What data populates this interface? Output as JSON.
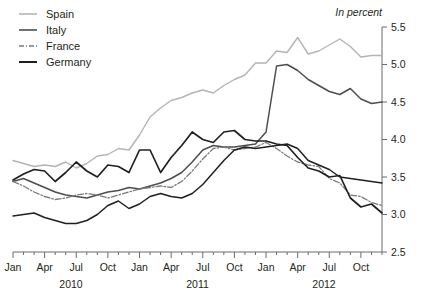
{
  "chart_data": {
    "type": "line",
    "title": "",
    "subtitle": "",
    "unit_note": "In percent",
    "xlabel": "",
    "ylabel": "",
    "ylim": [
      2.5,
      5.5
    ],
    "ytick_values": [
      2.5,
      3.0,
      3.5,
      4.0,
      4.5,
      5.0,
      5.5
    ],
    "ytick_labels": [
      "2.5",
      "3.0",
      "3.5",
      "4.0",
      "4.5",
      "5.0",
      "5.5"
    ],
    "y_axis_position": "right",
    "grid": false,
    "legend_position": "top-left",
    "xtick_labels": [
      "Jan",
      "Apr",
      "Jul",
      "Oct",
      "Jan",
      "Apr",
      "Jul",
      "Oct",
      "Jan",
      "Apr",
      "Jul",
      "Oct"
    ],
    "year_labels": [
      "2010",
      "2011",
      "2012"
    ],
    "x": [
      "2010-01",
      "2010-02",
      "2010-03",
      "2010-04",
      "2010-05",
      "2010-06",
      "2010-07",
      "2010-08",
      "2010-09",
      "2010-10",
      "2010-11",
      "2010-12",
      "2011-01",
      "2011-02",
      "2011-03",
      "2011-04",
      "2011-05",
      "2011-06",
      "2011-07",
      "2011-08",
      "2011-09",
      "2011-10",
      "2011-11",
      "2011-12",
      "2012-01",
      "2012-02",
      "2012-03",
      "2012-04",
      "2012-05",
      "2012-06",
      "2012-07",
      "2012-08",
      "2012-09",
      "2012-10",
      "2012-11",
      "2012-12"
    ],
    "series": [
      {
        "name": "Spain",
        "color": "#b4b4b4",
        "style": "solid",
        "width": 1.4,
        "values": [
          3.72,
          3.68,
          3.64,
          3.66,
          3.64,
          3.7,
          3.62,
          3.68,
          3.78,
          3.8,
          3.88,
          3.86,
          4.06,
          4.3,
          4.42,
          4.52,
          4.56,
          4.62,
          4.66,
          4.62,
          4.72,
          4.8,
          4.86,
          5.02,
          5.02,
          5.18,
          5.16,
          5.36,
          5.14,
          5.18,
          5.26,
          5.34,
          5.24,
          5.1,
          5.12,
          5.12
        ]
      },
      {
        "name": "Italy",
        "color": "#4d4d4d",
        "style": "solid",
        "width": 1.5,
        "values": [
          3.44,
          3.48,
          3.42,
          3.36,
          3.3,
          3.26,
          3.24,
          3.22,
          3.26,
          3.3,
          3.32,
          3.36,
          3.34,
          3.38,
          3.42,
          3.48,
          3.56,
          3.7,
          3.86,
          3.92,
          3.9,
          3.9,
          3.92,
          3.94,
          4.1,
          4.98,
          5.0,
          4.92,
          4.8,
          4.72,
          4.64,
          4.6,
          4.68,
          4.54,
          4.48,
          4.5
        ]
      },
      {
        "name": "France",
        "color": "#7a7a7a",
        "style": "dashdot",
        "width": 1.3,
        "values": [
          3.44,
          3.38,
          3.3,
          3.24,
          3.2,
          3.22,
          3.26,
          3.28,
          3.26,
          3.22,
          3.26,
          3.3,
          3.34,
          3.36,
          3.38,
          3.36,
          3.44,
          3.58,
          3.74,
          3.88,
          3.9,
          3.86,
          3.88,
          3.9,
          3.96,
          3.88,
          3.78,
          3.7,
          3.66,
          3.64,
          3.48,
          3.42,
          3.26,
          3.24,
          3.16,
          3.12
        ]
      },
      {
        "name": "Germany",
        "color": "#231f20",
        "style": "solid",
        "width": 1.7,
        "values": [
          3.46,
          3.54,
          3.6,
          3.58,
          3.44,
          3.56,
          3.7,
          3.58,
          3.5,
          3.66,
          3.64,
          3.56,
          3.86,
          3.86,
          3.56,
          3.76,
          3.92,
          4.1,
          4.0,
          3.96,
          4.1,
          4.12,
          4.0,
          3.98,
          3.98,
          3.94,
          3.92,
          3.76,
          3.62,
          3.58,
          3.5,
          3.52,
          3.22,
          3.1,
          3.14,
          3.02
        ]
      },
      {
        "name": "Germany-low",
        "color": "#231f20",
        "style": "solid",
        "width": 1.5,
        "values": [
          2.98,
          3.0,
          3.02,
          2.96,
          2.92,
          2.88,
          2.88,
          2.92,
          3.0,
          3.12,
          3.18,
          3.08,
          3.14,
          3.24,
          3.28,
          3.24,
          3.22,
          3.28,
          3.4,
          3.56,
          3.72,
          3.86,
          3.9,
          3.88,
          3.9,
          3.92,
          3.94,
          3.88,
          3.72,
          3.66,
          3.6,
          3.5,
          3.48,
          3.46,
          3.44,
          3.42
        ]
      }
    ]
  },
  "legend": {
    "items": [
      {
        "label": "Spain"
      },
      {
        "label": "Italy"
      },
      {
        "label": "France"
      },
      {
        "label": "Germany"
      }
    ]
  }
}
